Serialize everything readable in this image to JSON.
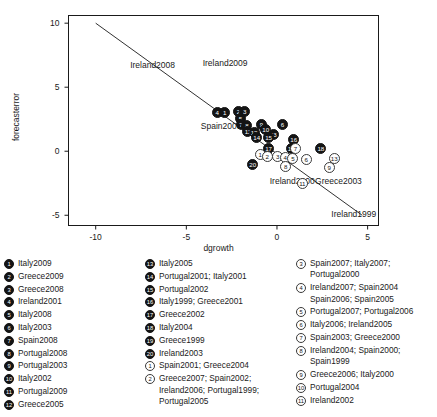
{
  "chart_data": {
    "type": "scatter",
    "title": "",
    "xlabel": "dgrowth",
    "ylabel": "forecasterror",
    "xlim": [
      -11.5,
      5.6
    ],
    "ylim": [
      -5.8,
      10.6
    ],
    "xticks": [
      "-10",
      "-5",
      "0",
      "5"
    ],
    "xtick_values": [
      -10,
      -5,
      0,
      5
    ],
    "yticks": [
      "-5",
      "0",
      "5",
      "10"
    ],
    "ytick_values": [
      -5,
      0,
      5,
      10
    ],
    "grid": false,
    "legend_position": "below-plot-three-columns",
    "fit_line": {
      "label": "regression-line",
      "x": [
        -10,
        4.7
      ],
      "y": [
        10,
        -5
      ]
    },
    "annotations": [
      {
        "text": "Ireland2008",
        "x": -8.1,
        "y": 6.7
      },
      {
        "text": "Ireland2009",
        "x": -4.1,
        "y": 6.9
      },
      {
        "text": "Spain2009",
        "x": -4.2,
        "y": 2.0
      },
      {
        "text": "Ireland2000",
        "x": -0.4,
        "y": -2.3
      },
      {
        "text": "Greece2003",
        "x": 2.1,
        "y": -2.3
      },
      {
        "text": "Ireland1999",
        "x": 3.0,
        "y": -4.9
      }
    ],
    "points": [
      {
        "id": "4",
        "style": "filled",
        "x": -3.3,
        "y": 3.02
      },
      {
        "id": "1",
        "style": "filled",
        "x": -2.88,
        "y": 3.04
      },
      {
        "id": "2",
        "style": "filled",
        "x": -2.12,
        "y": 3.1
      },
      {
        "id": "3",
        "style": "filled",
        "x": -1.78,
        "y": 3.08
      },
      {
        "id": "5",
        "style": "filled",
        "x": -2.02,
        "y": 2.52
      },
      {
        "id": "7",
        "style": "filled",
        "x": -1.98,
        "y": 2.06
      },
      {
        "id": "8",
        "style": "filled",
        "x": -1.66,
        "y": 2.02
      },
      {
        "id": "9",
        "style": "filled",
        "x": -0.86,
        "y": 2.05
      },
      {
        "id": "6",
        "style": "filled",
        "x": 0.3,
        "y": 2.08
      },
      {
        "id": "10",
        "style": "filled",
        "x": -0.62,
        "y": 1.72
      },
      {
        "id": "11",
        "style": "filled",
        "x": -1.6,
        "y": 1.52
      },
      {
        "id": "12",
        "style": "filled",
        "x": -1.26,
        "y": 1.46
      },
      {
        "id": "13",
        "style": "filled",
        "x": -0.2,
        "y": 1.32
      },
      {
        "id": "14",
        "style": "filled",
        "x": -1.12,
        "y": 1.1
      },
      {
        "id": "15",
        "style": "filled",
        "x": -0.46,
        "y": 1.06
      },
      {
        "id": "16",
        "style": "filled",
        "x": 0.92,
        "y": 0.88
      },
      {
        "id": "17",
        "style": "filled",
        "x": -0.46,
        "y": 0.18
      },
      {
        "id": "19",
        "style": "filled",
        "x": 0.78,
        "y": 0.2
      },
      {
        "id": "18",
        "style": "filled",
        "x": 2.42,
        "y": 0.22
      },
      {
        "id": "20",
        "style": "filled",
        "x": -1.34,
        "y": -1.02
      },
      {
        "id": "1",
        "style": "open",
        "x": -0.92,
        "y": -0.24
      },
      {
        "id": "2",
        "style": "open",
        "x": -0.54,
        "y": -0.38
      },
      {
        "id": "3",
        "style": "open",
        "x": 0.04,
        "y": -0.42
      },
      {
        "id": "4",
        "style": "open",
        "x": 0.46,
        "y": -0.52
      },
      {
        "id": "5",
        "style": "open",
        "x": 0.88,
        "y": -0.56
      },
      {
        "id": "7",
        "style": "open",
        "x": 1.02,
        "y": 0.18
      },
      {
        "id": "6",
        "style": "open",
        "x": 1.62,
        "y": -0.62
      },
      {
        "id": "8",
        "style": "open",
        "x": 0.48,
        "y": -1.18
      },
      {
        "id": "13",
        "style": "open",
        "x": 3.16,
        "y": -0.58
      },
      {
        "id": "9",
        "style": "open",
        "x": 2.88,
        "y": -1.26
      },
      {
        "id": "11",
        "style": "open",
        "x": 1.4,
        "y": -2.5
      }
    ]
  },
  "legend": {
    "columns": [
      {
        "name": "legend-column-1",
        "items": [
          {
            "marker": "1",
            "style": "filled",
            "label": "Italy2009"
          },
          {
            "marker": "2",
            "style": "filled",
            "label": "Greece2009"
          },
          {
            "marker": "3",
            "style": "filled",
            "label": "Greece2008"
          },
          {
            "marker": "4",
            "style": "filled",
            "label": "Ireland2001"
          },
          {
            "marker": "5",
            "style": "filled",
            "label": "Italy2008"
          },
          {
            "marker": "6",
            "style": "filled",
            "label": "Italy2003"
          },
          {
            "marker": "7",
            "style": "filled",
            "label": "Spain2008"
          },
          {
            "marker": "8",
            "style": "filled",
            "label": "Portugal2008"
          },
          {
            "marker": "9",
            "style": "filled",
            "label": "Portugal2003"
          },
          {
            "marker": "10",
            "style": "filled",
            "label": "Italy2002"
          },
          {
            "marker": "11",
            "style": "filled",
            "label": "Portugal2009"
          },
          {
            "marker": "12",
            "style": "filled",
            "label": "Greece2005"
          }
        ]
      },
      {
        "name": "legend-column-2",
        "items": [
          {
            "marker": "13",
            "style": "filled",
            "label": "Italy2005"
          },
          {
            "marker": "14",
            "style": "filled",
            "label": "Portugal2001; Italy2001"
          },
          {
            "marker": "15",
            "style": "filled",
            "label": "Portugal2002"
          },
          {
            "marker": "16",
            "style": "filled",
            "label": "Italy1999; Greece2001"
          },
          {
            "marker": "17",
            "style": "filled",
            "label": "Greece2002"
          },
          {
            "marker": "18",
            "style": "filled",
            "label": "Italy2004"
          },
          {
            "marker": "19",
            "style": "filled",
            "label": "Greece1999"
          },
          {
            "marker": "20",
            "style": "filled",
            "label": "Ireland2003"
          },
          {
            "marker": "1",
            "style": "open",
            "label": "Spain2001; Greece2004"
          },
          {
            "marker": "2",
            "style": "open",
            "label": "Greece2007; Spain2002; Ireland2006; Portugal1999; Portugal2005"
          }
        ]
      },
      {
        "name": "legend-column-3",
        "items": [
          {
            "marker": "3",
            "style": "open",
            "label": "Spain2007; Italy2007; Portugal2000"
          },
          {
            "marker": "4",
            "style": "open",
            "label": "Ireland2007; Spain2004 Spain2006; Spain2005"
          },
          {
            "marker": "5",
            "style": "open",
            "label": "Portugal2007; Portugal2006"
          },
          {
            "marker": "6",
            "style": "open",
            "label": "Italy2006; Ireland2005"
          },
          {
            "marker": "7",
            "style": "open",
            "label": "Spain2003; Greece2000"
          },
          {
            "marker": "8",
            "style": "open",
            "label": "Ireland2004; Spain2000; Spain1999"
          },
          {
            "marker": "9",
            "style": "open",
            "label": "Greece2006; Italy2000"
          },
          {
            "marker": "10",
            "style": "open",
            "label": "Portugal2004"
          },
          {
            "marker": "11",
            "style": "open",
            "label": "Ireland2002"
          }
        ]
      }
    ]
  }
}
